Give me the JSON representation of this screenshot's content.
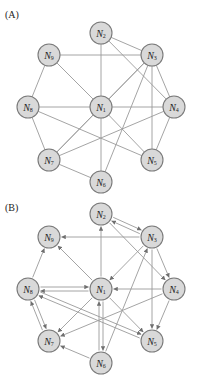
{
  "panels": [
    {
      "id": "A",
      "label": "(A)",
      "label_pos": [
        5,
        18
      ],
      "directed": false,
      "nodes": [
        {
          "id": "N1",
          "base": "N",
          "sub": "1",
          "x": 101,
          "y": 107
        },
        {
          "id": "N2",
          "base": "N",
          "sub": "2",
          "x": 101,
          "y": 33
        },
        {
          "id": "N3",
          "base": "N",
          "sub": "3",
          "x": 152,
          "y": 55
        },
        {
          "id": "N4",
          "base": "N",
          "sub": "4",
          "x": 174,
          "y": 107
        },
        {
          "id": "N5",
          "base": "N",
          "sub": "5",
          "x": 152,
          "y": 160
        },
        {
          "id": "N6",
          "base": "N",
          "sub": "6",
          "x": 101,
          "y": 182
        },
        {
          "id": "N7",
          "base": "N",
          "sub": "7",
          "x": 49,
          "y": 160
        },
        {
          "id": "N8",
          "base": "N",
          "sub": "8",
          "x": 28,
          "y": 107
        },
        {
          "id": "N9",
          "base": "N",
          "sub": "9",
          "x": 49,
          "y": 55
        }
      ],
      "edges": [
        [
          "N2",
          "N1"
        ],
        [
          "N2",
          "N3"
        ],
        [
          "N2",
          "N4"
        ],
        [
          "N9",
          "N3"
        ],
        [
          "N9",
          "N1"
        ],
        [
          "N9",
          "N8"
        ],
        [
          "N3",
          "N1"
        ],
        [
          "N3",
          "N4"
        ],
        [
          "N3",
          "N5"
        ],
        [
          "N3",
          "N7"
        ],
        [
          "N3",
          "N6"
        ],
        [
          "N8",
          "N1"
        ],
        [
          "N8",
          "N7"
        ],
        [
          "N8",
          "N5"
        ],
        [
          "N1",
          "N4"
        ],
        [
          "N1",
          "N7"
        ],
        [
          "N1",
          "N5"
        ],
        [
          "N1",
          "N6"
        ],
        [
          "N4",
          "N7"
        ],
        [
          "N4",
          "N5"
        ],
        [
          "N7",
          "N6"
        ]
      ]
    },
    {
      "id": "B",
      "label": "(B)",
      "label_pos": [
        5,
        211
      ],
      "directed": true,
      "nodes": [
        {
          "id": "N1",
          "base": "N",
          "sub": "1",
          "x": 101,
          "y": 289
        },
        {
          "id": "N2",
          "base": "N",
          "sub": "2",
          "x": 101,
          "y": 214
        },
        {
          "id": "N3",
          "base": "N",
          "sub": "3",
          "x": 152,
          "y": 237
        },
        {
          "id": "N4",
          "base": "N",
          "sub": "4",
          "x": 174,
          "y": 289
        },
        {
          "id": "N5",
          "base": "N",
          "sub": "5",
          "x": 152,
          "y": 341
        },
        {
          "id": "N6",
          "base": "N",
          "sub": "6",
          "x": 101,
          "y": 363
        },
        {
          "id": "N7",
          "base": "N",
          "sub": "7",
          "x": 49,
          "y": 341
        },
        {
          "id": "N8",
          "base": "N",
          "sub": "8",
          "x": 28,
          "y": 289
        },
        {
          "id": "N9",
          "base": "N",
          "sub": "9",
          "x": 49,
          "y": 237
        }
      ],
      "edges": [
        {
          "from": "N1",
          "to": "N2",
          "offset": 0
        },
        {
          "from": "N2",
          "to": "N3",
          "offset": -2
        },
        {
          "from": "N3",
          "to": "N2",
          "offset": -2
        },
        {
          "from": "N2",
          "to": "N4",
          "offset": 0
        },
        {
          "from": "N3",
          "to": "N9",
          "offset": 0
        },
        {
          "from": "N1",
          "to": "N9",
          "offset": 0
        },
        {
          "from": "N8",
          "to": "N9",
          "offset": 0
        },
        {
          "from": "N3",
          "to": "N1",
          "offset": 0
        },
        {
          "from": "N3",
          "to": "N4",
          "offset": 0
        },
        {
          "from": "N3",
          "to": "N5",
          "offset": 0
        },
        {
          "from": "N6",
          "to": "N3",
          "offset": 0
        },
        {
          "from": "N1",
          "to": "N8",
          "offset": -2
        },
        {
          "from": "N8",
          "to": "N1",
          "offset": -2
        },
        {
          "from": "N4",
          "to": "N1",
          "offset": 0
        },
        {
          "from": "N1",
          "to": "N7",
          "offset": 0
        },
        {
          "from": "N1",
          "to": "N5",
          "offset": 0
        },
        {
          "from": "N1",
          "to": "N6",
          "offset": -2
        },
        {
          "from": "N6",
          "to": "N1",
          "offset": -2
        },
        {
          "from": "N4",
          "to": "N7",
          "offset": 0
        },
        {
          "from": "N4",
          "to": "N5",
          "offset": 0
        },
        {
          "from": "N8",
          "to": "N7",
          "offset": -2
        },
        {
          "from": "N7",
          "to": "N8",
          "offset": -2
        },
        {
          "from": "N8",
          "to": "N5",
          "offset": -2
        },
        {
          "from": "N5",
          "to": "N8",
          "offset": -2
        },
        {
          "from": "N6",
          "to": "N7",
          "offset": 0
        }
      ]
    }
  ],
  "style": {
    "node_radius": 11,
    "node_fill": "#d9d9d9",
    "node_stroke": "#7a7a7a",
    "edge_color": "#9a9a9a"
  }
}
